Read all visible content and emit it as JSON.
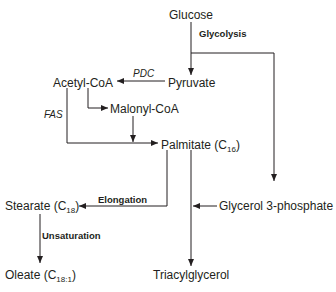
{
  "diagram": {
    "type": "metabolic-pathway",
    "nodes": {
      "glucose": {
        "label": "Glucose"
      },
      "pyruvate": {
        "label": "Pyruvate"
      },
      "acetyl_coa": {
        "label": "Acetyl-CoA"
      },
      "malonyl_coa": {
        "label": "Malonyl-CoA"
      },
      "palmitate": {
        "label": "Palmitate (C",
        "sub": "16",
        "close": ")"
      },
      "stearate": {
        "label": "Stearate (C",
        "sub": "18",
        "close": ")"
      },
      "glycerol_3_phosphate": {
        "label": "Glycerol 3-phosphate"
      },
      "oleate": {
        "label": "Oleate (C",
        "sub": "18:1",
        "close": ")"
      },
      "triacylglycerol": {
        "label": "Triacylglycerol"
      }
    },
    "edge_labels": {
      "glycolysis": "Glycolysis",
      "pdc": "PDC",
      "fas": "FAS",
      "elongation": "Elongation",
      "unsaturation": "Unsaturation"
    },
    "edges": [
      {
        "from": "Glucose",
        "to": "Pyruvate",
        "label": "Glycolysis"
      },
      {
        "from": "Glucose",
        "to": "Glycerol 3-phosphate"
      },
      {
        "from": "Pyruvate",
        "to": "Acetyl-CoA",
        "label": "PDC"
      },
      {
        "from": "Acetyl-CoA",
        "to": "Malonyl-CoA"
      },
      {
        "from": "Acetyl-CoA",
        "to": "Palmitate (C16)",
        "label": "FAS"
      },
      {
        "from": "Malonyl-CoA",
        "to": "Palmitate (C16)"
      },
      {
        "from": "Palmitate (C16)",
        "to": "Stearate (C18)",
        "label": "Elongation"
      },
      {
        "from": "Palmitate (C16)",
        "to": "Triacylglycerol"
      },
      {
        "from": "Glycerol 3-phosphate",
        "to": "Triacylglycerol"
      },
      {
        "from": "Stearate (C18)",
        "to": "Oleate (C18:1)",
        "label": "Unsaturation"
      }
    ]
  }
}
